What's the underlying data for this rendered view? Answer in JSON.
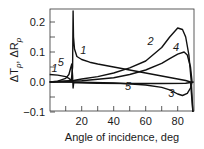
{
  "chart_data": {
    "type": "line",
    "title": "",
    "xlabel": "Angle of incidence, deg",
    "ylabel": "ΔTp, ΔRp",
    "xlim": [
      0,
      90
    ],
    "ylim": [
      -0.1,
      0.237
    ],
    "x_ticks": [
      20,
      40,
      60,
      80
    ],
    "x_minor_ticks": [
      10,
      30,
      50,
      70
    ],
    "y_ticks": [
      -0.1,
      0.0,
      0.1,
      0.2
    ],
    "y_tick_labels": [
      "−0.1",
      "0.0",
      "0.1",
      "0.2"
    ],
    "y_minor_ticks": [
      -0.05,
      0.05,
      0.15
    ],
    "grid": false,
    "legend": "inline curve numbers",
    "series": [
      {
        "name": "1",
        "x": [
          0,
          5,
          10,
          12,
          13.5,
          14.3,
          14.6,
          14.9,
          15.5,
          17,
          20,
          25,
          30,
          40,
          50,
          60,
          70,
          80,
          85,
          88,
          89.5
        ],
        "y": [
          0.025,
          0.023,
          0.018,
          0.012,
          0.005,
          0.05,
          0.237,
          0.15,
          0.11,
          0.085,
          0.075,
          0.066,
          0.06,
          0.05,
          0.04,
          0.03,
          0.02,
          0.01,
          0.005,
          0.0,
          -0.1
        ]
      },
      {
        "name": "2",
        "x": [
          0,
          15,
          20,
          30,
          40,
          50,
          60,
          70,
          75,
          80,
          83,
          85,
          87,
          88.5,
          89.5
        ],
        "y": [
          0.0,
          0.005,
          0.01,
          0.018,
          0.03,
          0.047,
          0.07,
          0.115,
          0.15,
          0.18,
          0.175,
          0.15,
          0.09,
          0.0,
          -0.1
        ]
      },
      {
        "name": "3",
        "x": [
          0,
          20,
          40,
          60,
          70,
          75,
          80,
          83,
          86,
          88,
          89
        ],
        "y": [
          0.0,
          -0.001,
          -0.003,
          -0.01,
          -0.018,
          -0.026,
          -0.04,
          -0.045,
          -0.038,
          -0.02,
          0.0
        ]
      },
      {
        "name": "4",
        "x": [
          0,
          20,
          40,
          50,
          60,
          70,
          75,
          80,
          84,
          86,
          88,
          89
        ],
        "y": [
          0.0,
          0.004,
          0.014,
          0.025,
          0.04,
          0.062,
          0.078,
          0.093,
          0.1,
          0.09,
          0.05,
          0.0
        ]
      },
      {
        "name": "5",
        "x": [
          0,
          5,
          10,
          12,
          13,
          13.8,
          14.3,
          14.6,
          15,
          17,
          30,
          50,
          70,
          85,
          90
        ],
        "y": [
          0.0,
          0.003,
          0.012,
          0.025,
          0.045,
          0.06,
          0.02,
          -0.02,
          -0.002,
          -0.003,
          -0.004,
          -0.005,
          -0.005,
          -0.004,
          0.0
        ]
      }
    ],
    "annotations": [
      {
        "text": "1",
        "x": 21,
        "y": 0.095
      },
      {
        "text": "1",
        "x": 3,
        "y": 0.035
      },
      {
        "text": "5",
        "x": 7,
        "y": 0.055
      },
      {
        "text": "2",
        "x": 63,
        "y": 0.125
      },
      {
        "text": "4",
        "x": 79,
        "y": 0.105
      },
      {
        "text": "5",
        "x": 49,
        "y": -0.025
      },
      {
        "text": "3",
        "x": 76,
        "y": -0.05
      }
    ]
  }
}
